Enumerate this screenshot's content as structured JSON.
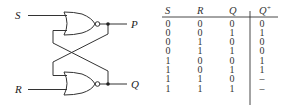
{
  "circuit": {
    "inputs": [
      {
        "name": "S"
      },
      {
        "name": "R"
      }
    ],
    "outputs": [
      {
        "name": "P"
      },
      {
        "name": "Q"
      }
    ],
    "gates": [
      {
        "type": "NOR",
        "position": "top"
      },
      {
        "type": "NOR",
        "position": "bottom"
      }
    ],
    "line_color": "#333333"
  },
  "truth_table": {
    "headers": [
      "S",
      "R",
      "Q",
      "Q+"
    ],
    "header_display": {
      "S": "S",
      "R": "R",
      "Q": "Q",
      "Qplus_base": "Q",
      "Qplus_sup": "+"
    },
    "rows": [
      [
        "0",
        "0",
        "0",
        "0"
      ],
      [
        "0",
        "0",
        "1",
        "1"
      ],
      [
        "0",
        "1",
        "0",
        "0"
      ],
      [
        "0",
        "1",
        "1",
        "0"
      ],
      [
        "1",
        "0",
        "0",
        "1"
      ],
      [
        "1",
        "0",
        "1",
        "1"
      ],
      [
        "1",
        "1",
        "0",
        "–"
      ],
      [
        "1",
        "1",
        "1",
        "–"
      ]
    ]
  }
}
